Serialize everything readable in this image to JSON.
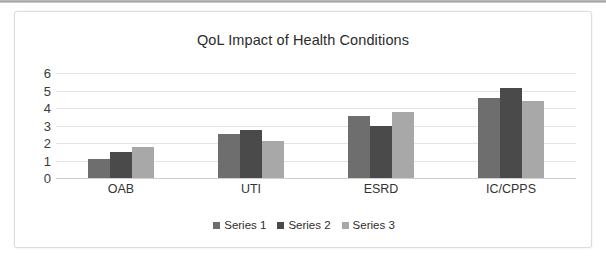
{
  "chart_data": {
    "type": "bar",
    "title": "QoL Impact of Health Conditions",
    "xlabel": "",
    "ylabel": "",
    "ylim": [
      0,
      6
    ],
    "yticks": [
      0,
      1,
      2,
      3,
      4,
      5,
      6
    ],
    "grid": true,
    "legend_position": "bottom",
    "categories": [
      "OAB",
      "UTI",
      "ESRD",
      "IC/CPPS"
    ],
    "series": [
      {
        "name": "Series 1",
        "color": "#6e6e6e",
        "values": [
          1.1,
          2.5,
          3.55,
          4.55
        ]
      },
      {
        "name": "Series 2",
        "color": "#4a4a4a",
        "values": [
          1.5,
          2.75,
          2.95,
          5.15
        ]
      },
      {
        "name": "Series 3",
        "color": "#a8a8a8",
        "values": [
          1.8,
          2.1,
          3.75,
          4.4
        ]
      }
    ]
  }
}
